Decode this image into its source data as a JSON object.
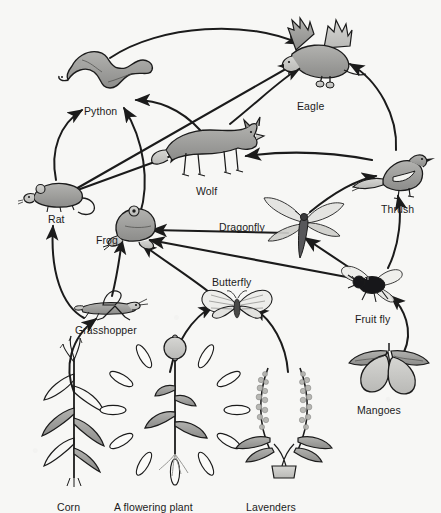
{
  "diagram": {
    "background_color": "#f7f7f5",
    "ink_color": "#1b1b1b",
    "fill_mid": "#9a9a98",
    "fill_light": "#c9c9c6",
    "fill_dark": "#6e6e6c"
  },
  "organisms": [
    {
      "id": "python",
      "label": "Python",
      "label_x": 84,
      "label_y": 105,
      "x": 112,
      "y": 72,
      "trophic": "tertiary-consumer",
      "group": "animal"
    },
    {
      "id": "eagle",
      "label": "Eagle",
      "label_x": 297,
      "label_y": 100,
      "x": 322,
      "y": 58,
      "trophic": "apex-predator",
      "group": "animal"
    },
    {
      "id": "wolf",
      "label": "Wolf",
      "label_x": 196,
      "label_y": 185,
      "x": 212,
      "y": 148,
      "trophic": "tertiary-consumer",
      "group": "animal"
    },
    {
      "id": "rat",
      "label": "Rat",
      "label_x": 48,
      "label_y": 213,
      "x": 58,
      "y": 194,
      "trophic": "primary-consumer",
      "group": "animal"
    },
    {
      "id": "frog",
      "label": "Frog",
      "label_x": 96,
      "label_y": 234,
      "x": 133,
      "y": 224,
      "trophic": "secondary-consumer",
      "group": "animal"
    },
    {
      "id": "thrush",
      "label": "Thrush",
      "label_x": 381,
      "label_y": 203,
      "x": 397,
      "y": 175,
      "trophic": "secondary-consumer",
      "group": "animal"
    },
    {
      "id": "dragonfly",
      "label": "Dragonfly",
      "label_x": 219,
      "label_y": 221,
      "x": 302,
      "y": 222,
      "trophic": "secondary-consumer",
      "group": "animal"
    },
    {
      "id": "butterfly",
      "label": "Butterfly",
      "label_x": 212,
      "label_y": 276,
      "x": 237,
      "y": 305,
      "trophic": "primary-consumer",
      "group": "animal"
    },
    {
      "id": "fruit-fly",
      "label": "Fruit fly",
      "label_x": 355,
      "label_y": 313,
      "x": 372,
      "y": 283,
      "trophic": "primary-consumer",
      "group": "animal"
    },
    {
      "id": "grasshopper",
      "label": "Grasshopper",
      "label_x": 75,
      "label_y": 324,
      "x": 107,
      "y": 305,
      "trophic": "primary-consumer",
      "group": "animal"
    },
    {
      "id": "mangoes",
      "label": "Mangoes",
      "label_x": 357,
      "label_y": 404,
      "x": 389,
      "y": 365,
      "trophic": "producer",
      "group": "plant"
    },
    {
      "id": "corn",
      "label": "Corn",
      "label_x": 57,
      "label_y": 501,
      "x": 74,
      "y": 420,
      "trophic": "producer",
      "group": "plant"
    },
    {
      "id": "flowering-plant",
      "label": "A flowering plant",
      "label_x": 114,
      "label_y": 501,
      "x": 175,
      "y": 410,
      "trophic": "producer",
      "group": "plant"
    },
    {
      "id": "lavenders",
      "label": "Lavenders",
      "label_x": 246,
      "label_y": 501,
      "x": 284,
      "y": 420,
      "trophic": "producer",
      "group": "plant"
    }
  ],
  "arrows": [
    {
      "from": "corn",
      "to": "grasshopper",
      "path": "M 74 392 C 64 368, 70 338, 96 319",
      "style": "curved"
    },
    {
      "from": "grasshopper",
      "to": "rat",
      "path": "M 84 318 C 62 306, 50 272, 53 226",
      "style": "curved"
    },
    {
      "from": "grasshopper",
      "to": "frog",
      "path": "M 112 296 C 118 272, 120 254, 122 240",
      "style": "curved"
    },
    {
      "from": "flowering-plant",
      "to": "butterfly",
      "path": "M 170 372 C 176 342, 192 318, 213 306",
      "style": "curved"
    },
    {
      "from": "lavenders",
      "to": "butterfly",
      "path": "M 288 372 C 286 344, 272 320, 254 308",
      "style": "curved"
    },
    {
      "from": "mangoes",
      "to": "fruit-fly",
      "path": "M 404 352 C 414 330, 404 308, 391 296",
      "style": "curved"
    },
    {
      "from": "butterfly",
      "to": "frog",
      "path": "M 214 296 C 192 278, 160 258, 142 244",
      "style": "curved"
    },
    {
      "from": "fruit-fly",
      "to": "frog",
      "path": "M 352 278 L 150 240",
      "style": "straight"
    },
    {
      "from": "fruit-fly",
      "to": "dragonfly",
      "path": "M 350 268 L 305 238",
      "style": "straight"
    },
    {
      "from": "fruit-fly",
      "to": "thrush",
      "path": "M 388 268 C 400 244, 402 214, 398 196",
      "style": "curved"
    },
    {
      "from": "dragonfly",
      "to": "frog",
      "path": "M 288 233 L 152 230",
      "style": "straight"
    },
    {
      "from": "dragonfly",
      "to": "thrush",
      "path": "M 310 212 C 332 194, 356 180, 376 176",
      "style": "curved"
    },
    {
      "from": "thrush",
      "to": "eagle",
      "path": "M 396 150 C 398 116, 378 80, 350 64",
      "style": "curved"
    },
    {
      "from": "thrush",
      "to": "wolf",
      "path": "M 372 160 C 320 150, 276 152, 246 156",
      "style": "straight"
    },
    {
      "from": "frog",
      "to": "python",
      "path": "M 140 214 C 150 182, 144 140, 124 108",
      "style": "curved"
    },
    {
      "from": "rat",
      "to": "python",
      "path": "M 56 180 C 50 150, 60 124, 82 110",
      "style": "curved"
    },
    {
      "from": "rat",
      "to": "wolf",
      "path": "M 72 192 L 182 152",
      "style": "straight"
    },
    {
      "from": "rat",
      "to": "eagle",
      "path": "M 74 190 L 298 62",
      "style": "straight"
    },
    {
      "from": "wolf",
      "to": "python",
      "path": "M 200 130 C 180 108, 156 100, 136 100",
      "style": "curved"
    },
    {
      "from": "wolf",
      "to": "eagle",
      "path": "M 230 124 C 260 100, 282 78, 300 68",
      "style": "curved"
    },
    {
      "from": "python",
      "to": "eagle",
      "path": "M 110 58 C 160 24, 250 20, 300 44",
      "style": "curved"
    }
  ]
}
